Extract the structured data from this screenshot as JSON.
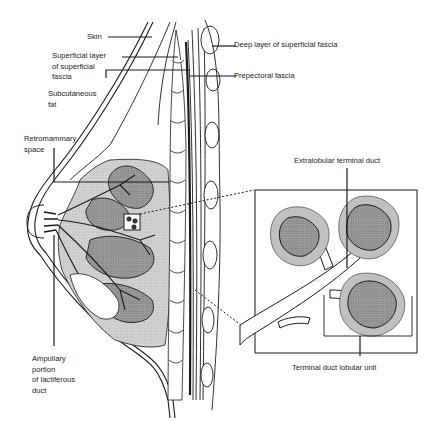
{
  "labels": {
    "skin": "Skin",
    "superficial_layer": "Superficial layer\nof superficial\nfascia",
    "subcutaneous_fat": "Subcutaneous\nfat",
    "retromammary_space": "Retromammary\nspace",
    "ampullary_portion": "Ampullary\nportion\nof lactiferous\nduct",
    "deep_layer": "Deep layer of superficial fascia",
    "prepectoral_fascia": "Prepectoral fascia",
    "extralobular_duct": "Extralobular terminal duct",
    "tdlu": "Terminal duct lobular unit"
  },
  "colors": {
    "line": "#1a1a1a",
    "gland_fill": "#c8c8c8",
    "tissue_fill": "#9a9a9a",
    "lobule_outer": "#bdbdbd",
    "lobule_inner": "#8c8c8c"
  }
}
